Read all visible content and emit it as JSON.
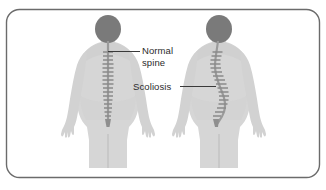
{
  "figure": {
    "frame": {
      "border_color": "#6b6b6b",
      "background_color": "#ffffff"
    },
    "palette": {
      "body_fill": "#d6d6d6",
      "body_shade": "#c8c8c8",
      "head_fill": "#7a7a7a",
      "spine_fill": "#9a9a9a",
      "vertebra_fill": "#8a8a8a",
      "leader_line": "#3a3a3a",
      "text": "#2b2b2b"
    },
    "labels": [
      {
        "name": "normal-spine",
        "line1": "Normal",
        "line2": "spine",
        "leader_direction": "left"
      },
      {
        "name": "scoliosis",
        "line1": "Scoliosis",
        "line2": "",
        "leader_direction": "right"
      }
    ],
    "figures": [
      {
        "name": "normal-figure",
        "spine_type": "straight",
        "description": "Human back view with straight vertical spine"
      },
      {
        "name": "scoliosis-figure",
        "spine_type": "s-curve",
        "description": "Human back view with laterally curved spine"
      }
    ]
  }
}
